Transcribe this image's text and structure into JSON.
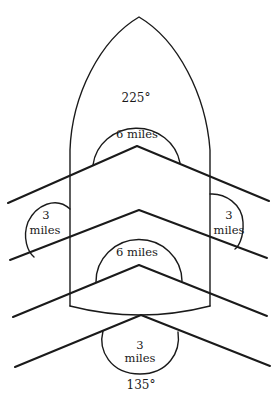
{
  "diagram": {
    "labels": {
      "bearing_top": "225°",
      "bearing_bottom": "135°",
      "upper_center_radius": "6 miles",
      "lower_center_radius": "6 miles",
      "left_radius_value": "3",
      "left_radius_unit": "miles",
      "right_radius_value": "3",
      "right_radius_unit": "miles",
      "bottom_radius_value": "3",
      "bottom_radius_unit": "miles"
    },
    "stroke_color": "#1a1a1a",
    "background_color": "#ffffff"
  }
}
